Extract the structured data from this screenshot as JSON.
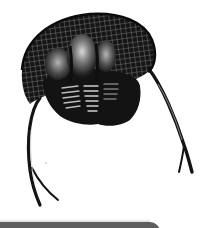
{
  "image": {
    "subject": "trilobite illustration",
    "alt": "Black-and-white engraving of a trilobite with a reticulated cephalon, segmented thorax and two long curved genal spines"
  },
  "colors": {
    "background": "#ffffff",
    "body": "#141414",
    "highlight": "#d9d9d9",
    "bottom_bar": "#5e5e5e"
  }
}
